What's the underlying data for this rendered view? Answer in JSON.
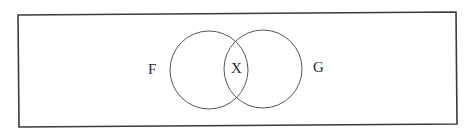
{
  "diagram": {
    "type": "venn",
    "frame": {
      "corners": [
        [
          18,
          15
        ],
        [
          456,
          12
        ],
        [
          457,
          124
        ],
        [
          19,
          127
        ]
      ],
      "stroke": "#3a3a3a"
    },
    "sets": [
      {
        "id": "F",
        "label": "F",
        "cx": 209,
        "cy": 70,
        "r": 39,
        "label_x": 148,
        "label_y": 74
      },
      {
        "id": "G",
        "label": "G",
        "cx": 263,
        "cy": 69,
        "r": 39,
        "label_x": 313,
        "label_y": 72
      }
    ],
    "intersection": {
      "label": "X",
      "label_x": 231,
      "label_y": 73
    },
    "circle_stroke": "#555555"
  }
}
